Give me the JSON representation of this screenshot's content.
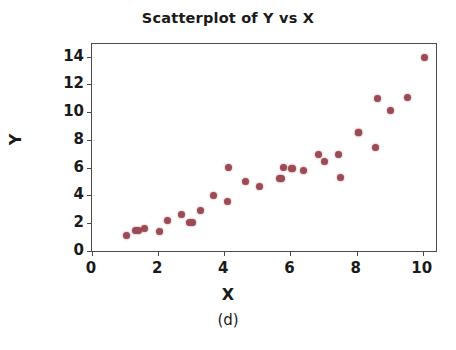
{
  "chart_data": {
    "type": "scatter",
    "title": "Scatterplot of Y vs X",
    "xlabel": "X",
    "ylabel": "Y",
    "caption": "(d)",
    "xlim": [
      0,
      10.4
    ],
    "ylim": [
      0,
      14.9
    ],
    "xticks": [
      0,
      2,
      4,
      6,
      8,
      10
    ],
    "yticks": [
      0,
      2,
      4,
      6,
      8,
      10,
      12,
      14
    ],
    "xtick_labels": [
      "0",
      "2",
      "4",
      "6",
      "8",
      "10"
    ],
    "ytick_labels": [
      "0",
      "2",
      "4",
      "6",
      "8",
      "10",
      "12",
      "14"
    ],
    "grid": false,
    "legend": null,
    "marker_color": "#9c4a54",
    "marker_size": 7,
    "frame_color": "#4a4a4a",
    "background": "#ffffff",
    "n_points": 32,
    "points": [
      {
        "x": 1.03,
        "y": 1.1
      },
      {
        "x": 1.42,
        "y": 1.5
      },
      {
        "x": 1.6,
        "y": 1.65
      },
      {
        "x": 2.05,
        "y": 1.42
      },
      {
        "x": 2.27,
        "y": 2.18
      },
      {
        "x": 2.7,
        "y": 2.62
      },
      {
        "x": 3.05,
        "y": 2.05
      },
      {
        "x": 3.27,
        "y": 2.95
      },
      {
        "x": 3.68,
        "y": 4.02
      },
      {
        "x": 4.1,
        "y": 3.55
      },
      {
        "x": 4.14,
        "y": 6.02
      },
      {
        "x": 4.65,
        "y": 5.0
      },
      {
        "x": 5.05,
        "y": 4.62
      },
      {
        "x": 5.68,
        "y": 5.2
      },
      {
        "x": 5.8,
        "y": 5.98
      },
      {
        "x": 6.05,
        "y": 5.95
      },
      {
        "x": 6.38,
        "y": 5.78
      },
      {
        "x": 6.85,
        "y": 6.95
      },
      {
        "x": 7.02,
        "y": 6.45
      },
      {
        "x": 7.45,
        "y": 6.92
      },
      {
        "x": 7.52,
        "y": 5.28
      },
      {
        "x": 8.05,
        "y": 8.55
      },
      {
        "x": 8.58,
        "y": 7.45
      },
      {
        "x": 8.62,
        "y": 10.95
      },
      {
        "x": 9.02,
        "y": 10.12
      },
      {
        "x": 9.55,
        "y": 11.05
      },
      {
        "x": 10.05,
        "y": 13.95
      },
      {
        "x": 1.3,
        "y": 1.48
      },
      {
        "x": 2.95,
        "y": 2.08
      },
      {
        "x": 5.72,
        "y": 5.22
      },
      {
        "x": 6.02,
        "y": 5.92
      },
      {
        "x": 8.05,
        "y": 8.52
      }
    ]
  }
}
